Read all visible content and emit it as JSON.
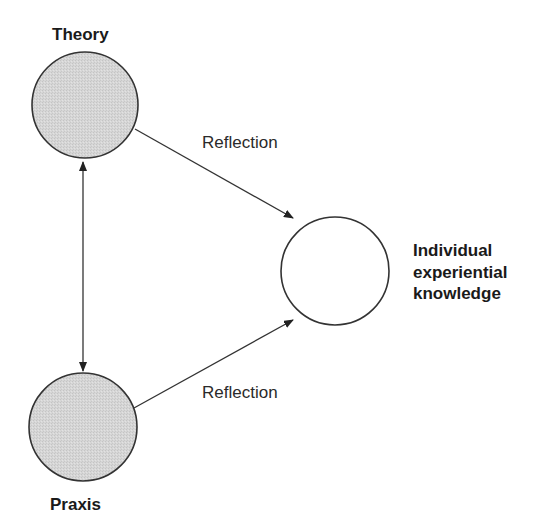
{
  "diagram": {
    "nodes": [
      {
        "id": "theory",
        "label": "Theory",
        "fill": "#d4d4d4",
        "shaded": true
      },
      {
        "id": "praxis",
        "label": "Praxis",
        "fill": "#d4d4d4",
        "shaded": true
      },
      {
        "id": "knowledge",
        "label_lines": [
          "Individual",
          "experiential",
          "knowledge"
        ],
        "fill": "#ffffff",
        "shaded": false
      }
    ],
    "edges": [
      {
        "from": "theory",
        "to": "knowledge",
        "label": "Reflection",
        "direction": "one-way"
      },
      {
        "from": "praxis",
        "to": "knowledge",
        "label": "Reflection",
        "direction": "one-way"
      },
      {
        "from": "theory",
        "to": "praxis",
        "label": "",
        "direction": "two-way"
      }
    ],
    "colors": {
      "stroke": "#333333",
      "shaded_fill": "#d4d4d4",
      "background": "#ffffff"
    }
  }
}
